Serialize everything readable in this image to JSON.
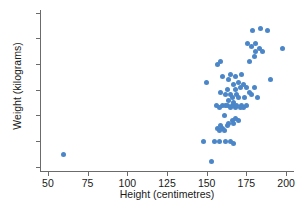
{
  "chart_data": {
    "type": "scatter",
    "title": "",
    "xlabel": "Height (centimetres)",
    "ylabel": "Weight (kilograms)",
    "xlim": [
      45,
      205
    ],
    "ylim": [
      38,
      101
    ],
    "xticks": [
      50,
      75,
      100,
      125,
      150,
      175,
      200
    ],
    "yticks": [
      40,
      50,
      60,
      70,
      80,
      90,
      100
    ],
    "grid": false,
    "legend": false,
    "point_color": "#4a86c8",
    "axis_color": "#6b6b6b",
    "series": [
      {
        "name": "observations",
        "points": [
          [
            60,
            45
          ],
          [
            148,
            50
          ],
          [
            150,
            73
          ],
          [
            153,
            42
          ],
          [
            155,
            50
          ],
          [
            156,
            64
          ],
          [
            157,
            55
          ],
          [
            157,
            80
          ],
          [
            158,
            50
          ],
          [
            158,
            63
          ],
          [
            158,
            54
          ],
          [
            159,
            56
          ],
          [
            159,
            69
          ],
          [
            159,
            81
          ],
          [
            160,
            55
          ],
          [
            160,
            64
          ],
          [
            160,
            75
          ],
          [
            161,
            54
          ],
          [
            161,
            60
          ],
          [
            162,
            50
          ],
          [
            162,
            64
          ],
          [
            162,
            68
          ],
          [
            163,
            56
          ],
          [
            163,
            70
          ],
          [
            163,
            64
          ],
          [
            164,
            57
          ],
          [
            164,
            66
          ],
          [
            164,
            74
          ],
          [
            165,
            50
          ],
          [
            165,
            63
          ],
          [
            165,
            68
          ],
          [
            165,
            76
          ],
          [
            166,
            58
          ],
          [
            166,
            67
          ],
          [
            166,
            64
          ],
          [
            167,
            49
          ],
          [
            167,
            57
          ],
          [
            167,
            72
          ],
          [
            167,
            65
          ],
          [
            168,
            59
          ],
          [
            168,
            63
          ],
          [
            168,
            70
          ],
          [
            168,
            75
          ],
          [
            169,
            64
          ],
          [
            169,
            68
          ],
          [
            170,
            58
          ],
          [
            170,
            67
          ],
          [
            170,
            73
          ],
          [
            171,
            63
          ],
          [
            171,
            71
          ],
          [
            172,
            64
          ],
          [
            172,
            76
          ],
          [
            173,
            63
          ],
          [
            173,
            72
          ],
          [
            174,
            67
          ],
          [
            175,
            64
          ],
          [
            175,
            71
          ],
          [
            176,
            88
          ],
          [
            177,
            69
          ],
          [
            177,
            81
          ],
          [
            178,
            68
          ],
          [
            178,
            87
          ],
          [
            179,
            93
          ],
          [
            180,
            71
          ],
          [
            180,
            83
          ],
          [
            181,
            85
          ],
          [
            181,
            88
          ],
          [
            182,
            67
          ],
          [
            183,
            86
          ],
          [
            184,
            94
          ],
          [
            185,
            85
          ],
          [
            188,
            93
          ],
          [
            190,
            74
          ],
          [
            198,
            86
          ]
        ]
      }
    ]
  }
}
